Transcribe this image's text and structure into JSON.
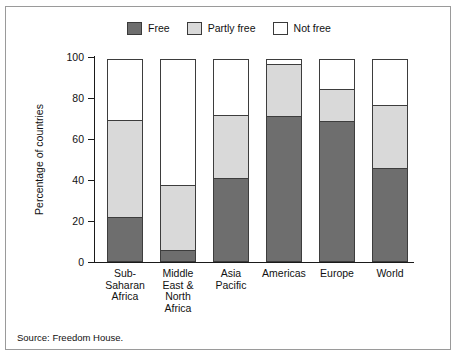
{
  "legend": {
    "entries": [
      {
        "label": "Free",
        "color": "#6e6e6e"
      },
      {
        "label": "Partly free",
        "color": "#d9d9d9"
      },
      {
        "label": "Not free",
        "color": "#ffffff"
      }
    ]
  },
  "axes": {
    "y_title": "Percentage of countries",
    "y_ticks": [
      "100",
      "80",
      "60",
      "40",
      "20",
      "0"
    ]
  },
  "source": "Source: Freedom House.",
  "chart_data": {
    "type": "bar",
    "subtype": "stacked-bar-100-percent",
    "title": "",
    "subtitle": "",
    "xlabel": "",
    "ylabel": "Percentage of countries",
    "ylim": [
      0,
      100
    ],
    "ytick_step": 20,
    "grid": false,
    "legend_position": "top-center",
    "categories": [
      "Sub-Saharan Africa",
      "Middle East & North Africa",
      "Asia Pacific",
      "Americas",
      "Europe",
      "World"
    ],
    "category_label_lines": [
      [
        "Sub-",
        "Saharan",
        "Africa"
      ],
      [
        "Middle",
        "East &",
        "North",
        "Africa"
      ],
      [
        "Asia",
        "Pacific"
      ],
      [
        "Americas"
      ],
      [
        "Europe"
      ],
      [
        "World"
      ]
    ],
    "series": [
      {
        "name": "Free",
        "color": "#6e6e6e",
        "values": [
          22,
          6,
          41,
          71,
          69,
          46
        ]
      },
      {
        "name": "Partly free",
        "color": "#d9d9d9",
        "values": [
          48,
          32,
          31,
          26,
          16,
          31
        ]
      },
      {
        "name": "Not free",
        "color": "#ffffff",
        "values": [
          30,
          62,
          28,
          3,
          15,
          23
        ]
      }
    ],
    "cumulative_tops": {
      "free": [
        22,
        6,
        41,
        71,
        69,
        46
      ],
      "partly_free": [
        70,
        38,
        72,
        97,
        85,
        77
      ],
      "not_free": [
        100,
        100,
        100,
        100,
        100,
        100
      ]
    }
  }
}
